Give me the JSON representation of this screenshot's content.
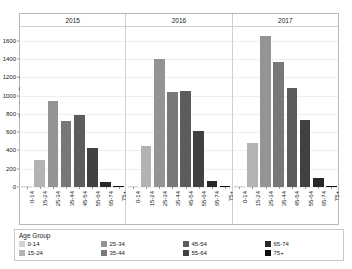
{
  "chart_data": {
    "type": "bar",
    "title": "",
    "subtitle": "",
    "xlabel": "",
    "ylabel": "Overdose Deaths",
    "ylim": [
      0,
      1750
    ],
    "yticks": [
      0,
      200,
      400,
      600,
      800,
      1000,
      1200,
      1400,
      1600
    ],
    "ytick_labels": [
      "0",
      "200",
      "400",
      "600",
      "800",
      "1000",
      "1200",
      "1400",
      "1600"
    ],
    "grid": true,
    "legend_position": "bottom",
    "legend_title": "Age Group",
    "facet_label": "year",
    "facets": [
      "2015",
      "2016",
      "2017"
    ],
    "categories": [
      "0-14",
      "15-24",
      "25-34",
      "35-44",
      "45-54",
      "55-64",
      "65-74",
      "75+"
    ],
    "colors": {
      "0-14": "#d4d4d4",
      "15-24": "#b3b3b3",
      "25-34": "#949494",
      "35-44": "#787878",
      "45-54": "#5c5c5c",
      "55-64": "#414141",
      "65-74": "#272727",
      "75+": "#0d0d0d"
    },
    "series": [
      {
        "name": "2015",
        "categories": [
          "0-14",
          "15-24",
          "25-34",
          "35-44",
          "45-54",
          "55-64",
          "65-74",
          "75+"
        ],
        "values": [
          8,
          300,
          945,
          720,
          785,
          425,
          60,
          6
        ]
      },
      {
        "name": "2016",
        "categories": [
          "0-14",
          "15-24",
          "25-34",
          "35-44",
          "45-54",
          "55-64",
          "65-74",
          "75+"
        ],
        "values": [
          10,
          450,
          1400,
          1040,
          1050,
          615,
          65,
          8
        ]
      },
      {
        "name": "2017",
        "categories": [
          "0-14",
          "15-24",
          "25-34",
          "35-44",
          "45-54",
          "55-64",
          "65-74",
          "75+"
        ],
        "values": [
          10,
          480,
          1655,
          1370,
          1085,
          730,
          100,
          8
        ]
      }
    ]
  },
  "legend": {
    "title": "Age Group",
    "items": [
      {
        "label": "0-14",
        "color": "#d4d4d4"
      },
      {
        "label": "15-24",
        "color": "#b3b3b3"
      },
      {
        "label": "25-34",
        "color": "#949494"
      },
      {
        "label": "35-44",
        "color": "#787878"
      },
      {
        "label": "45-54",
        "color": "#5c5c5c"
      },
      {
        "label": "55-64",
        "color": "#414141"
      },
      {
        "label": "65-74",
        "color": "#272727"
      },
      {
        "label": "75+",
        "color": "#0d0d0d"
      }
    ]
  },
  "axes": {
    "y_title": "Overdose Deaths"
  }
}
